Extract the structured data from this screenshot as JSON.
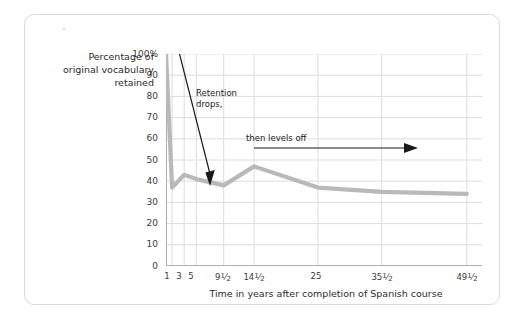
{
  "chart_data": {
    "type": "line",
    "title": "",
    "xlabel": "Time in years after completion of Spanish course",
    "ylabel": "Percentage of original vocabulary retained",
    "ylim": [
      0,
      100
    ],
    "xlim": [
      0,
      50
    ],
    "grid": true,
    "legend": "none",
    "line_color": "#b9b9b9",
    "x": [
      0,
      1,
      3,
      5,
      9.5,
      14.5,
      25,
      35.5,
      49.5
    ],
    "values": [
      100,
      37,
      43,
      41,
      38,
      47,
      37,
      35,
      34
    ],
    "y_ticks": [
      "0",
      "10",
      "20",
      "30",
      "40",
      "50",
      "60",
      "70",
      "80",
      "90",
      "100%"
    ],
    "y_tick_values": [
      0,
      10,
      20,
      30,
      40,
      50,
      60,
      70,
      80,
      90,
      100
    ],
    "x_ticks": [
      "1",
      "3",
      "5",
      "9½",
      "14½",
      "25",
      "35½",
      "49½"
    ],
    "x_tick_values": [
      1,
      3,
      5,
      9.5,
      14.5,
      25,
      35.5,
      49.5
    ],
    "annotations": [
      {
        "text": "Retention drops,",
        "line1": "Retention",
        "line2": "drops,",
        "kind": "arrow-down"
      },
      {
        "text": "then levels off",
        "line1": "then levels off",
        "kind": "arrow-right"
      }
    ]
  },
  "axis": {
    "y_title_line1": "Percentage of",
    "y_title_line2": "original vocabulary",
    "y_title_line3": "retained",
    "x_title": "Time in years after completion of Spanish course",
    "y_labels": {
      "t100": "100%",
      "t90": "90",
      "t80": "80",
      "t70": "70",
      "t60": "60",
      "t50": "50",
      "t40": "40",
      "t30": "30",
      "t20": "20",
      "t10": "10",
      "t0": "0"
    },
    "x_labels": {
      "x1": "1",
      "x3": "3",
      "x5": "5",
      "x95_whole": "9",
      "x95_num": "1",
      "x95_den": "2",
      "x145_whole": "14",
      "x145_num": "1",
      "x145_den": "2",
      "x25": "25",
      "x355_whole": "35",
      "x355_num": "1",
      "x355_den": "2",
      "x495_whole": "49",
      "x495_num": "1",
      "x495_den": "2"
    }
  },
  "annotations": {
    "drop_line1": "Retention",
    "drop_line2": "drops,",
    "level_text": "then levels off"
  },
  "colors": {
    "line": "#b9b9b9",
    "grid": "#dcdcdc",
    "axis": "#b0b0b0",
    "text": "#2b2b2b",
    "frame": "#d9d9d9"
  }
}
